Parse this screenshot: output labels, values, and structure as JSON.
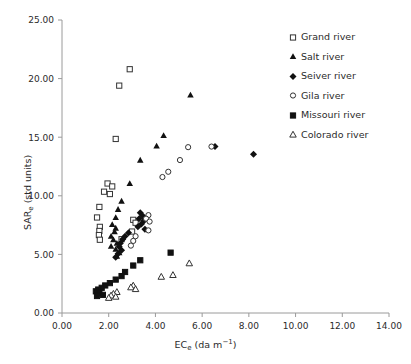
{
  "chart_data": {
    "type": "scatter",
    "title": "",
    "xlabel": "EC_e (da m^-1)",
    "ylabel": "SAR_e (std units)",
    "xlim": [
      0.0,
      14.0
    ],
    "ylim": [
      0.0,
      25.0
    ],
    "xticks": [
      "0.00",
      "2.00",
      "4.00",
      "6.00",
      "8.00",
      "10.00",
      "12.00",
      "14.00"
    ],
    "yticks": [
      "0.00",
      "5.00",
      "10.00",
      "15.00",
      "20.00",
      "25.00"
    ],
    "grid": false,
    "legend_position": "top-right",
    "series": [
      {
        "name": "Grand river",
        "marker": "open-square",
        "color": "#000000",
        "points": [
          [
            2.9,
            20.8
          ],
          [
            2.45,
            19.4
          ],
          [
            2.3,
            14.85
          ],
          [
            1.95,
            11.05
          ],
          [
            2.15,
            10.8
          ],
          [
            1.8,
            10.35
          ],
          [
            2.05,
            10.15
          ],
          [
            1.6,
            9.05
          ],
          [
            1.5,
            8.15
          ],
          [
            1.62,
            7.35
          ],
          [
            1.6,
            7.0
          ],
          [
            1.58,
            6.65
          ],
          [
            1.62,
            6.25
          ],
          [
            3.05,
            7.95
          ],
          [
            3.15,
            7.7
          ],
          [
            3.0,
            6.95
          ],
          [
            2.55,
            6.3
          ]
        ]
      },
      {
        "name": "Salt river",
        "marker": "filled-triangle",
        "color": "#000000",
        "points": [
          [
            5.5,
            18.6
          ],
          [
            4.35,
            15.15
          ],
          [
            4.05,
            14.25
          ],
          [
            3.35,
            13.05
          ],
          [
            2.9,
            11.05
          ],
          [
            2.55,
            9.55
          ],
          [
            2.4,
            8.85
          ],
          [
            2.3,
            8.15
          ],
          [
            2.15,
            7.55
          ],
          [
            2.3,
            7.25
          ],
          [
            2.25,
            6.95
          ],
          [
            2.1,
            6.55
          ],
          [
            2.2,
            6.25
          ],
          [
            2.35,
            5.95
          ],
          [
            2.1,
            5.7
          ],
          [
            2.3,
            5.45
          ],
          [
            2.45,
            5.15
          ],
          [
            2.35,
            4.85
          ]
        ]
      },
      {
        "name": "Seiver river",
        "marker": "filled-diamond",
        "color": "#000000",
        "points": [
          [
            8.2,
            13.55
          ],
          [
            6.55,
            14.2
          ],
          [
            3.35,
            8.55
          ],
          [
            3.45,
            8.3
          ],
          [
            3.3,
            8.05
          ],
          [
            3.5,
            7.85
          ],
          [
            3.4,
            7.6
          ],
          [
            3.25,
            7.35
          ],
          [
            3.55,
            7.15
          ],
          [
            2.85,
            6.85
          ],
          [
            2.7,
            6.55
          ],
          [
            2.6,
            6.3
          ],
          [
            2.5,
            5.95
          ],
          [
            2.45,
            5.65
          ],
          [
            2.55,
            5.35
          ],
          [
            2.4,
            5.05
          ],
          [
            2.3,
            4.75
          ]
        ]
      },
      {
        "name": "Gila river",
        "marker": "open-circle",
        "color": "#000000",
        "points": [
          [
            6.4,
            14.2
          ],
          [
            5.4,
            14.15
          ],
          [
            5.05,
            13.05
          ],
          [
            4.55,
            12.05
          ],
          [
            4.3,
            11.6
          ],
          [
            3.7,
            8.35
          ],
          [
            3.6,
            8.05
          ],
          [
            3.75,
            7.8
          ],
          [
            3.7,
            7.05
          ],
          [
            3.15,
            6.55
          ],
          [
            3.05,
            6.15
          ],
          [
            2.95,
            5.75
          ]
        ]
      },
      {
        "name": "Missouri river",
        "marker": "filled-square",
        "color": "#000000",
        "points": [
          [
            4.65,
            5.15
          ],
          [
            3.35,
            4.5
          ],
          [
            3.05,
            4.05
          ],
          [
            2.7,
            3.5
          ],
          [
            2.55,
            3.15
          ],
          [
            2.3,
            2.85
          ],
          [
            2.05,
            2.55
          ],
          [
            1.85,
            2.35
          ],
          [
            1.7,
            2.15
          ],
          [
            1.55,
            2.0
          ],
          [
            1.45,
            1.85
          ],
          [
            1.6,
            1.7
          ],
          [
            1.75,
            1.55
          ],
          [
            1.5,
            1.45
          ]
        ]
      },
      {
        "name": "Colorado river",
        "marker": "open-triangle",
        "color": "#000000",
        "points": [
          [
            5.45,
            4.25
          ],
          [
            4.75,
            3.25
          ],
          [
            4.25,
            3.1
          ],
          [
            3.05,
            2.35
          ],
          [
            2.95,
            2.2
          ],
          [
            3.15,
            2.05
          ],
          [
            2.35,
            1.8
          ],
          [
            2.2,
            1.65
          ],
          [
            2.1,
            1.5
          ],
          [
            2.3,
            1.4
          ],
          [
            2.0,
            1.3
          ]
        ]
      }
    ]
  },
  "legend": {
    "items": [
      {
        "label": "Grand river",
        "marker": "open-square"
      },
      {
        "label": "Salt river",
        "marker": "filled-triangle"
      },
      {
        "label": "Seiver river",
        "marker": "filled-diamond"
      },
      {
        "label": "Gila river",
        "marker": "open-circle"
      },
      {
        "label": "Missouri river",
        "marker": "filled-square"
      },
      {
        "label": "Colorado river",
        "marker": "open-triangle"
      }
    ]
  },
  "axes": {
    "y_label_main": "SAR",
    "y_label_sub": "e",
    "y_label_tail": " (std units)",
    "x_label_main": "EC",
    "x_label_sub": "e",
    "x_label_tail_a": " (da m",
    "x_label_sup": "−1",
    "x_label_tail_b": ")"
  }
}
